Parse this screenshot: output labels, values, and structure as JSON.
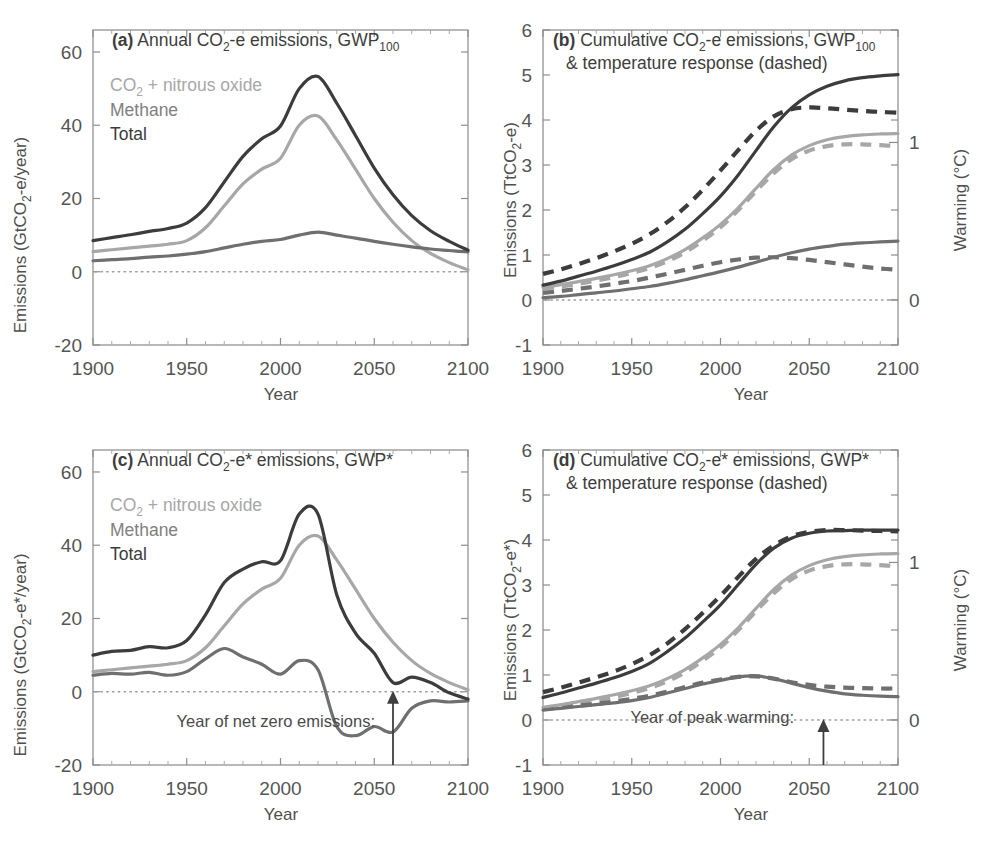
{
  "figure": {
    "panels": [
      "a",
      "b",
      "c",
      "d"
    ],
    "colors": {
      "co2_n2o": "#a7a7a7",
      "methane": "#6f6f6f",
      "total": "#3c3c3c",
      "axis": "#8d8d8d",
      "text": "#4a4a4a",
      "background": "#ffffff"
    }
  },
  "panel_a": {
    "label": "(a)",
    "title_main": "Annual CO",
    "title_sub": "2",
    "title_rest": "-e emissions, GWP",
    "title_sub2": "100",
    "legend": [
      {
        "key": "co2_n2o",
        "label_main": "CO",
        "label_sub": "2",
        "label_rest": " + nitrous oxide"
      },
      {
        "key": "methane",
        "label_main": "Methane",
        "label_sub": "",
        "label_rest": ""
      },
      {
        "key": "total",
        "label_main": "Total",
        "label_sub": "",
        "label_rest": ""
      }
    ],
    "ylabel_a": "Emissions (GtCO",
    "ylabel_sub": "2",
    "ylabel_b": "-e/year)",
    "xlabel": "Year",
    "yticks": [
      "-20",
      "0",
      "20",
      "40",
      "60"
    ],
    "xticks": [
      "1900",
      "1950",
      "2000",
      "2050",
      "2100"
    ]
  },
  "panel_b": {
    "label": "(b)",
    "title_line1_a": "Cumulative CO",
    "title_line1_sub": "2",
    "title_line1_b": "-e emissions, GWP",
    "title_line1_sub2": "100",
    "title_line2": "& temperature response (dashed)",
    "ylabel_a": "Emissions (TtCO",
    "ylabel_sub": "2",
    "ylabel_b": "-e)",
    "ylabel_right": "Warming (°C)",
    "xlabel": "Year",
    "yticks": [
      "-1",
      "0",
      "1",
      "2",
      "3",
      "4",
      "5",
      "6"
    ],
    "yticks_right": [
      "0",
      "1",
      "2"
    ],
    "xticks": [
      "1900",
      "1950",
      "2000",
      "2050",
      "2100"
    ]
  },
  "panel_c": {
    "label": "(c)",
    "title_main": "Annual CO",
    "title_sub": "2",
    "title_rest": "-e* emissions, GWP*",
    "legend": [
      {
        "key": "co2_n2o",
        "label_main": "CO",
        "label_sub": "2",
        "label_rest": " + nitrous oxide"
      },
      {
        "key": "methane",
        "label_main": "Methane",
        "label_sub": "",
        "label_rest": ""
      },
      {
        "key": "total",
        "label_main": "Total",
        "label_sub": "",
        "label_rest": ""
      }
    ],
    "ylabel_a": "Emissions (GtCO",
    "ylabel_sub": "2",
    "ylabel_b": "-e*/year)",
    "xlabel": "Year",
    "yticks": [
      "-20",
      "0",
      "20",
      "40",
      "60"
    ],
    "xticks": [
      "1900",
      "1950",
      "2000",
      "2050",
      "2100"
    ],
    "annotation": "Year of net zero emissions:",
    "annotation_year": 2060
  },
  "panel_d": {
    "label": "(d)",
    "title_line1_a": "Cumulative CO",
    "title_line1_sub": "2",
    "title_line1_b": "-e* emissions, GWP*",
    "title_line2": "& temperature response (dashed)",
    "ylabel_a": "Emissions (TtCO",
    "ylabel_sub": "2",
    "ylabel_b": "-e*)",
    "ylabel_right": "Warming (°C)",
    "xlabel": "Year",
    "yticks": [
      "-1",
      "0",
      "1",
      "2",
      "3",
      "4",
      "5",
      "6"
    ],
    "yticks_right": [
      "0",
      "1",
      "2"
    ],
    "xticks": [
      "1900",
      "1950",
      "2000",
      "2050",
      "2100"
    ],
    "annotation": "Year of peak warming:",
    "annotation_year": 2058
  },
  "chart_data": [
    {
      "panel": "a",
      "type": "line",
      "title": "(a) Annual CO2-e emissions, GWP100",
      "xlabel": "Year",
      "ylabel": "Emissions (GtCO2-e/year)",
      "xlim": [
        1900,
        2100
      ],
      "ylim": [
        -20,
        66
      ],
      "xticks": [
        1900,
        1950,
        2000,
        2050,
        2100
      ],
      "yticks": [
        -20,
        0,
        20,
        40,
        60
      ],
      "grid": false,
      "zero_line": true,
      "legend": [
        "CO2 + nitrous oxide",
        "Methane",
        "Total"
      ],
      "legend_position": "upper-left",
      "x": [
        1900,
        1910,
        1920,
        1930,
        1940,
        1950,
        1960,
        1970,
        1980,
        1990,
        2000,
        2010,
        2020,
        2030,
        2040,
        2050,
        2060,
        2070,
        2080,
        2090,
        2100
      ],
      "series": [
        {
          "name": "CO2 + nitrous oxide",
          "color": "#a7a7a7",
          "style": "solid",
          "values": [
            5.5,
            6.0,
            6.5,
            7.0,
            7.5,
            8.5,
            12.0,
            18.0,
            24.0,
            28.0,
            31.0,
            40.0,
            42.5,
            36.0,
            28.0,
            20.0,
            13.5,
            8.5,
            5.0,
            2.5,
            0.5
          ]
        },
        {
          "name": "Methane",
          "color": "#6f6f6f",
          "style": "solid",
          "values": [
            3.0,
            3.3,
            3.6,
            4.0,
            4.3,
            4.8,
            5.5,
            6.5,
            7.5,
            8.3,
            8.8,
            10.0,
            10.8,
            10.0,
            9.2,
            8.3,
            7.5,
            6.8,
            6.2,
            5.8,
            5.4
          ]
        },
        {
          "name": "Total",
          "color": "#3c3c3c",
          "style": "solid",
          "values": [
            8.5,
            9.3,
            10.1,
            11.0,
            11.8,
            13.3,
            17.5,
            24.5,
            31.5,
            36.3,
            39.8,
            50.0,
            53.3,
            46.0,
            37.2,
            28.3,
            21.0,
            15.3,
            11.2,
            8.3,
            5.9
          ]
        }
      ]
    },
    {
      "panel": "b",
      "type": "line",
      "title": "(b) Cumulative CO2-e emissions, GWP100 & temperature response (dashed)",
      "xlabel": "Year",
      "ylabel": "Emissions (TtCO2-e)",
      "ylabel_right": "Warming (°C)",
      "xlim": [
        1900,
        2100
      ],
      "ylim": [
        -1,
        6
      ],
      "ylim_right": [
        -0.286,
        1.714
      ],
      "xticks": [
        1900,
        1950,
        2000,
        2050,
        2100
      ],
      "yticks": [
        -1,
        0,
        1,
        2,
        3,
        4,
        5,
        6
      ],
      "yticks_right": [
        0,
        1,
        2
      ],
      "grid": false,
      "zero_line": true,
      "x": [
        1900,
        1910,
        1920,
        1930,
        1940,
        1950,
        1960,
        1970,
        1980,
        1990,
        2000,
        2010,
        2020,
        2030,
        2040,
        2050,
        2060,
        2070,
        2080,
        2090,
        2100
      ],
      "series": [
        {
          "name": "CO2 + nitrous oxide (cumulative)",
          "color": "#a7a7a7",
          "style": "solid",
          "values": [
            0.28,
            0.34,
            0.41,
            0.48,
            0.56,
            0.65,
            0.76,
            0.92,
            1.12,
            1.38,
            1.68,
            2.05,
            2.48,
            2.9,
            3.22,
            3.43,
            3.56,
            3.63,
            3.67,
            3.69,
            3.7
          ]
        },
        {
          "name": "Methane (cumulative)",
          "color": "#6f6f6f",
          "style": "solid",
          "values": [
            0.05,
            0.08,
            0.12,
            0.16,
            0.2,
            0.25,
            0.3,
            0.37,
            0.45,
            0.54,
            0.63,
            0.73,
            0.84,
            0.95,
            1.05,
            1.13,
            1.19,
            1.24,
            1.27,
            1.29,
            1.31
          ]
        },
        {
          "name": "Total (cumulative)",
          "color": "#3c3c3c",
          "style": "solid",
          "values": [
            0.33,
            0.42,
            0.53,
            0.64,
            0.76,
            0.9,
            1.06,
            1.29,
            1.57,
            1.92,
            2.31,
            2.78,
            3.32,
            3.85,
            4.27,
            4.56,
            4.75,
            4.87,
            4.94,
            4.98,
            5.01
          ]
        },
        {
          "name": "CO2 + nitrous oxide (warming)",
          "color": "#a7a7a7",
          "style": "dashed",
          "values": [
            0.25,
            0.3,
            0.36,
            0.43,
            0.51,
            0.6,
            0.71,
            0.86,
            1.06,
            1.32,
            1.62,
            2.0,
            2.42,
            2.82,
            3.13,
            3.32,
            3.42,
            3.46,
            3.46,
            3.44,
            3.42
          ]
        },
        {
          "name": "Methane (warming)",
          "color": "#6f6f6f",
          "style": "dashed",
          "values": [
            0.16,
            0.2,
            0.25,
            0.3,
            0.36,
            0.42,
            0.5,
            0.58,
            0.67,
            0.76,
            0.84,
            0.9,
            0.94,
            0.95,
            0.93,
            0.89,
            0.84,
            0.79,
            0.74,
            0.7,
            0.67
          ]
        },
        {
          "name": "Total (warming)",
          "color": "#3c3c3c",
          "style": "dashed",
          "values": [
            0.58,
            0.68,
            0.8,
            0.93,
            1.08,
            1.25,
            1.46,
            1.73,
            2.06,
            2.45,
            2.88,
            3.33,
            3.76,
            4.08,
            4.24,
            4.28,
            4.26,
            4.23,
            4.2,
            4.18,
            4.16
          ]
        }
      ]
    },
    {
      "panel": "c",
      "type": "line",
      "title": "(c) Annual CO2-e* emissions, GWP*",
      "xlabel": "Year",
      "ylabel": "Emissions (GtCO2-e*/year)",
      "xlim": [
        1900,
        2100
      ],
      "ylim": [
        -20,
        66
      ],
      "xticks": [
        1900,
        1950,
        2000,
        2050,
        2100
      ],
      "yticks": [
        -20,
        0,
        20,
        40,
        60
      ],
      "grid": false,
      "zero_line": true,
      "legend": [
        "CO2 + nitrous oxide",
        "Methane",
        "Total"
      ],
      "legend_position": "upper-left",
      "annotation": {
        "text": "Year of net zero emissions:",
        "year": 2060,
        "value": 0
      },
      "x": [
        1900,
        1910,
        1920,
        1930,
        1940,
        1950,
        1960,
        1970,
        1980,
        1990,
        2000,
        2010,
        2020,
        2030,
        2040,
        2050,
        2060,
        2070,
        2080,
        2090,
        2100
      ],
      "series": [
        {
          "name": "CO2 + nitrous oxide",
          "color": "#a7a7a7",
          "style": "solid",
          "values": [
            5.5,
            6.0,
            6.5,
            7.0,
            7.5,
            8.5,
            12.0,
            18.0,
            24.0,
            28.0,
            31.0,
            40.0,
            42.5,
            36.0,
            28.0,
            20.0,
            13.5,
            8.5,
            5.0,
            2.5,
            0.5
          ]
        },
        {
          "name": "Methane",
          "color": "#6f6f6f",
          "style": "solid",
          "values": [
            4.5,
            5.0,
            4.8,
            5.3,
            4.5,
            5.5,
            9.0,
            11.8,
            9.5,
            7.5,
            4.8,
            8.5,
            6.0,
            -9.5,
            -12.0,
            -9.5,
            -11.0,
            -4.5,
            -2.5,
            -2.8,
            -2.5
          ]
        },
        {
          "name": "Total",
          "color": "#3c3c3c",
          "style": "solid",
          "values": [
            10.0,
            11.0,
            11.3,
            12.3,
            12.0,
            14.0,
            21.0,
            29.8,
            33.5,
            35.5,
            35.8,
            48.5,
            48.5,
            26.5,
            16.0,
            10.5,
            2.5,
            4.0,
            2.5,
            -0.3,
            -2.0
          ]
        }
      ]
    },
    {
      "panel": "d",
      "type": "line",
      "title": "(d) Cumulative CO2-e* emissions, GWP* & temperature response (dashed)",
      "xlabel": "Year",
      "ylabel": "Emissions (TtCO2-e*)",
      "ylabel_right": "Warming (°C)",
      "xlim": [
        1900,
        2100
      ],
      "ylim": [
        -1,
        6
      ],
      "ylim_right": [
        -0.286,
        1.714
      ],
      "xticks": [
        1900,
        1950,
        2000,
        2050,
        2100
      ],
      "yticks": [
        -1,
        0,
        1,
        2,
        3,
        4,
        5,
        6
      ],
      "yticks_right": [
        0,
        1,
        2
      ],
      "grid": false,
      "zero_line": true,
      "annotation": {
        "text": "Year of peak warming:",
        "year": 2058,
        "value": 0
      },
      "x": [
        1900,
        1910,
        1920,
        1930,
        1940,
        1950,
        1960,
        1970,
        1980,
        1990,
        2000,
        2010,
        2020,
        2030,
        2040,
        2050,
        2060,
        2070,
        2080,
        2090,
        2100
      ],
      "series": [
        {
          "name": "CO2 + nitrous oxide (cumulative)",
          "color": "#a7a7a7",
          "style": "solid",
          "values": [
            0.28,
            0.34,
            0.41,
            0.48,
            0.56,
            0.65,
            0.76,
            0.92,
            1.12,
            1.38,
            1.68,
            2.05,
            2.48,
            2.9,
            3.22,
            3.43,
            3.56,
            3.63,
            3.67,
            3.69,
            3.7
          ]
        },
        {
          "name": "Methane (cumulative)",
          "color": "#6f6f6f",
          "style": "solid",
          "values": [
            0.22,
            0.26,
            0.3,
            0.34,
            0.38,
            0.43,
            0.5,
            0.6,
            0.7,
            0.8,
            0.88,
            0.96,
            0.98,
            0.92,
            0.82,
            0.72,
            0.64,
            0.58,
            0.55,
            0.53,
            0.52
          ]
        },
        {
          "name": "Total (cumulative)",
          "color": "#3c3c3c",
          "style": "solid",
          "values": [
            0.5,
            0.6,
            0.71,
            0.82,
            0.94,
            1.08,
            1.26,
            1.52,
            1.82,
            2.18,
            2.56,
            3.01,
            3.46,
            3.82,
            4.04,
            4.15,
            4.2,
            4.21,
            4.22,
            4.22,
            4.22
          ]
        },
        {
          "name": "CO2 + nitrous oxide (warming)",
          "color": "#a7a7a7",
          "style": "dashed",
          "values": [
            0.25,
            0.3,
            0.36,
            0.43,
            0.51,
            0.6,
            0.71,
            0.86,
            1.06,
            1.32,
            1.62,
            2.0,
            2.42,
            2.82,
            3.13,
            3.32,
            3.42,
            3.46,
            3.46,
            3.44,
            3.42
          ]
        },
        {
          "name": "Methane (warming)",
          "color": "#6f6f6f",
          "style": "dashed",
          "values": [
            0.24,
            0.28,
            0.32,
            0.36,
            0.41,
            0.47,
            0.54,
            0.63,
            0.73,
            0.83,
            0.9,
            0.96,
            0.97,
            0.92,
            0.84,
            0.78,
            0.74,
            0.72,
            0.71,
            0.7,
            0.7
          ]
        },
        {
          "name": "Total (warming)",
          "color": "#3c3c3c",
          "style": "dashed",
          "values": [
            0.62,
            0.72,
            0.83,
            0.95,
            1.08,
            1.24,
            1.44,
            1.7,
            2.02,
            2.38,
            2.76,
            3.18,
            3.58,
            3.88,
            4.08,
            4.18,
            4.22,
            4.22,
            4.21,
            4.2,
            4.19
          ]
        }
      ]
    }
  ]
}
